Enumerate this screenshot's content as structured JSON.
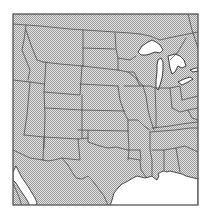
{
  "map": {
    "type": "outline-map",
    "region": "Central and Eastern United States",
    "land_color": "#d0d0d0",
    "water_color": "#ffffff",
    "border_color": "#4a4a4a",
    "frame_color": "#555555",
    "fill_pattern": "stipple",
    "water_bodies": [
      "Great Lakes",
      "Gulf of Mexico",
      "Gulf of California"
    ],
    "labels": []
  }
}
